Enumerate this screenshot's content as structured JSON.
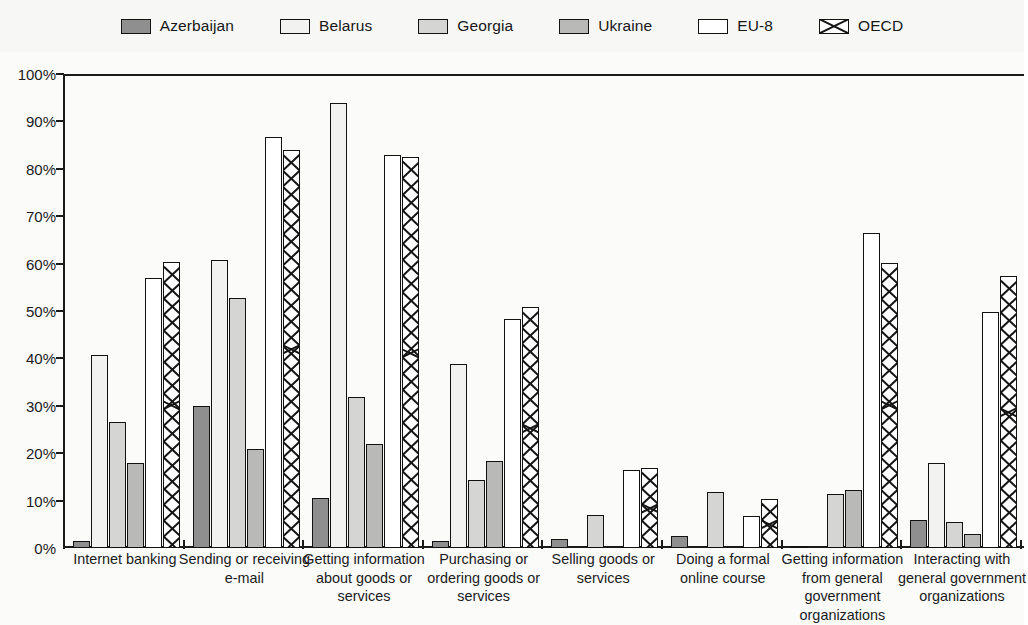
{
  "legend": {
    "items": [
      {
        "label": "Azerbaijan",
        "swatch": "legend-swatch-azerbaijan",
        "fill": "#8f8f8f",
        "pattern": "solid"
      },
      {
        "label": "Belarus",
        "swatch": "legend-swatch-belarus",
        "fill": "#f2f2f0",
        "pattern": "solid"
      },
      {
        "label": "Georgia",
        "swatch": "legend-swatch-georgia",
        "fill": "#d5d5d3",
        "pattern": "solid"
      },
      {
        "label": "Ukraine",
        "swatch": "legend-swatch-ukraine",
        "fill": "#b9b9b7",
        "pattern": "solid"
      },
      {
        "label": "EU-8",
        "swatch": "legend-swatch-eu8",
        "fill": "#ffffff",
        "pattern": "solid"
      },
      {
        "label": "OECD",
        "swatch": "legend-swatch-oecd",
        "fill": "#ffffff",
        "pattern": "crosshatch"
      }
    ]
  },
  "axis": {
    "y_ticks": [
      "0%",
      "10%",
      "20%",
      "30%",
      "40%",
      "50%",
      "60%",
      "70%",
      "80%",
      "90%",
      "100%"
    ]
  },
  "chart_data": {
    "type": "bar",
    "title": "",
    "xlabel": "",
    "ylabel": "",
    "ylim": [
      0,
      100
    ],
    "ytick_step": 10,
    "grid": false,
    "legend_position": "top",
    "categories": [
      "Internet banking",
      "Sending or receiving e-mail",
      "Getting information about goods or services",
      "Purchasing or ordering goods or services",
      "Selling goods or services",
      "Doing a formal online course",
      "Getting information from general government organizations",
      "Interacting with general government organizations"
    ],
    "series": [
      {
        "name": "Azerbaijan",
        "values": [
          1.5,
          30.0,
          10.5,
          1.5,
          2.0,
          2.5,
          0.3,
          6.0
        ]
      },
      {
        "name": "Belarus",
        "values": [
          40.8,
          60.8,
          93.8,
          38.8,
          0,
          0,
          0,
          18.0
        ]
      },
      {
        "name": "Georgia",
        "values": [
          26.6,
          52.8,
          31.8,
          14.4,
          7.0,
          11.8,
          11.3,
          5.5
        ]
      },
      {
        "name": "Ukraine",
        "values": [
          18.0,
          20.8,
          22.0,
          18.4,
          0,
          0,
          12.3,
          3.0
        ]
      },
      {
        "name": "EU-8",
        "values": [
          57.0,
          86.8,
          83.0,
          48.4,
          16.5,
          6.8,
          66.4,
          49.8
        ]
      },
      {
        "name": "OECD",
        "values": [
          60.3,
          84.0,
          82.4,
          50.8,
          16.9,
          10.3,
          60.2,
          57.3
        ]
      }
    ]
  }
}
